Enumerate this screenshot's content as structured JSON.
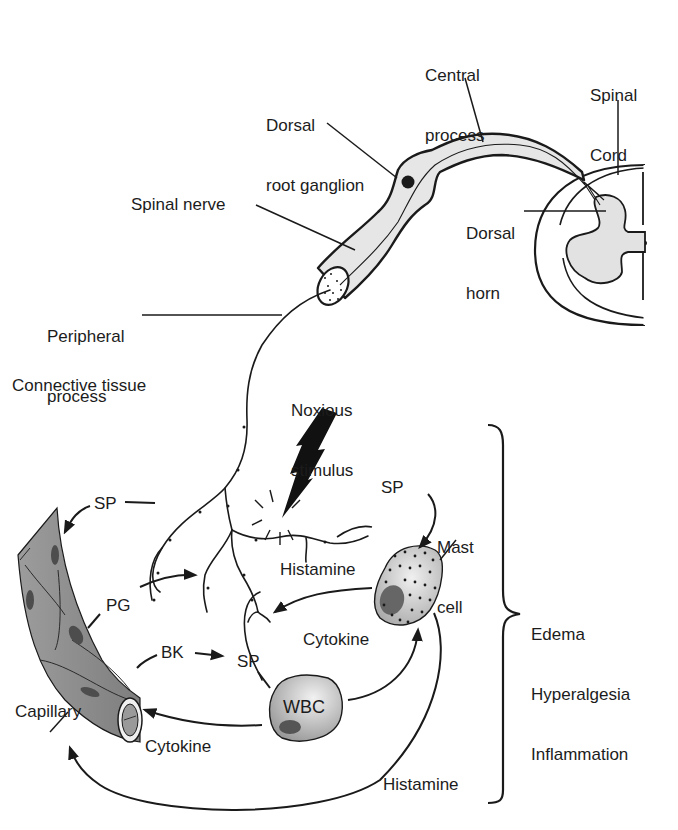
{
  "diagram": {
    "labels": {
      "central_process": [
        "Central",
        "process"
      ],
      "spinal_cord": [
        "Spinal",
        "Cord"
      ],
      "dorsal_root_ganglion": [
        "Dorsal",
        "root ganglion"
      ],
      "spinal_nerve": "Spinal nerve",
      "dorsal_horn": [
        "Dorsal",
        "horn"
      ],
      "peripheral_process": [
        "Peripheral",
        "process"
      ],
      "connective_tissue": "Connective tissue",
      "noxious_stimulus": [
        "Noxious",
        "stimulus"
      ],
      "sp_top_left": "SP",
      "sp_top_right": "SP",
      "mast_cell": [
        "Mast",
        "cell"
      ],
      "histamine_upper": "Histamine",
      "pg": "PG",
      "bk": "BK",
      "sp_center": "SP",
      "cytokine_right": "Cytokine",
      "wbc": "WBC",
      "capillary": "Capillary",
      "cytokine_bottom": "Cytokine",
      "histamine_lower": "Histamine",
      "effects": [
        "Edema",
        "Hyperalgesia",
        "Inflammation"
      ]
    },
    "colors": {
      "stroke": "#1a1a1a",
      "nerve_fill": "#e6e6e6",
      "gray_matter": "#e2e2e2",
      "capillary_fill": "#8f8f8f",
      "capillary_cell": "#555555",
      "wbc_fill": "#b8b8b8",
      "mast_fill": "#c8c8c8",
      "nucleus": "#555555"
    }
  }
}
